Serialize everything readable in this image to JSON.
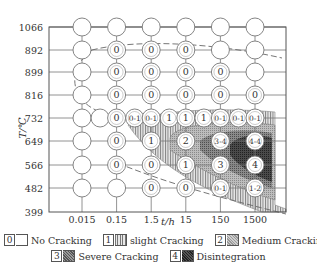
{
  "chart_data": {
    "type": "scatter",
    "subtype": "cracking-map grid (temperature vs. time)",
    "title": "",
    "xlabel": "t/h",
    "ylabel": "T/℃",
    "x_ticks": [
      "0.015",
      "0.15",
      "1.5",
      "15",
      "150",
      "1500"
    ],
    "y_ticks": [
      "1066",
      "892",
      "899",
      "816",
      "732",
      "649",
      "566",
      "482",
      "399"
    ],
    "x_scale": "log",
    "grid": true,
    "legend_position": "bottom",
    "legend": [
      {
        "code": "0",
        "label": "No Cracking"
      },
      {
        "code": "1",
        "label": "slight Cracking"
      },
      {
        "code": "2",
        "label": "Medium Cracking"
      },
      {
        "code": "3",
        "label": "Severe Cracking"
      },
      {
        "code": "4",
        "label": "Disintegration"
      }
    ],
    "rows": [
      {
        "T": "1066",
        "points": [
          {
            "t": "0.015",
            "grade": ""
          },
          {
            "t": "0.15",
            "grade": ""
          },
          {
            "t": "1.5",
            "grade": ""
          },
          {
            "t": "15",
            "grade": ""
          },
          {
            "t": "150",
            "grade": ""
          },
          {
            "t": "1500",
            "grade": ""
          }
        ]
      },
      {
        "T": "892",
        "points": [
          {
            "t": "0.015",
            "grade": ""
          },
          {
            "t": "0.15",
            "grade": "0"
          },
          {
            "t": "1.5",
            "grade": "0"
          },
          {
            "t": "15",
            "grade": "0"
          },
          {
            "t": "150",
            "grade": ""
          },
          {
            "t": "1500",
            "grade": ""
          }
        ]
      },
      {
        "T": "899",
        "points": [
          {
            "t": "0.015",
            "grade": ""
          },
          {
            "t": "0.15",
            "grade": "0"
          },
          {
            "t": "1.5",
            "grade": "0"
          },
          {
            "t": "15",
            "grade": "0"
          },
          {
            "t": "150",
            "grade": "0"
          },
          {
            "t": "1500",
            "grade": ""
          }
        ]
      },
      {
        "T": "816",
        "points": [
          {
            "t": "0.015",
            "grade": ""
          },
          {
            "t": "0.15",
            "grade": "0"
          },
          {
            "t": "1.5",
            "grade": "0"
          },
          {
            "t": "15",
            "grade": "0"
          },
          {
            "t": "150",
            "grade": "0"
          },
          {
            "t": "1500",
            "grade": "0"
          }
        ]
      },
      {
        "T": "732",
        "points": [
          {
            "t": "0.015",
            "grade": ""
          },
          {
            "t": "0.05",
            "grade": ""
          },
          {
            "t": "0.15",
            "grade": "0"
          },
          {
            "t": "0.5",
            "grade": "0-1"
          },
          {
            "t": "1.5",
            "grade": "0-1"
          },
          {
            "t": "5",
            "grade": "1"
          },
          {
            "t": "15",
            "grade": "1"
          },
          {
            "t": "50",
            "grade": "1"
          },
          {
            "t": "150",
            "grade": "0-1"
          },
          {
            "t": "500",
            "grade": "0-1"
          },
          {
            "t": "1500",
            "grade": "0-1"
          }
        ]
      },
      {
        "T": "649",
        "points": [
          {
            "t": "0.015",
            "grade": ""
          },
          {
            "t": "0.15",
            "grade": "0"
          },
          {
            "t": "1.5",
            "grade": "1"
          },
          {
            "t": "15",
            "grade": "2"
          },
          {
            "t": "150",
            "grade": "3-4"
          },
          {
            "t": "1500",
            "grade": "4-4"
          }
        ]
      },
      {
        "T": "566",
        "points": [
          {
            "t": "0.015",
            "grade": ""
          },
          {
            "t": "0.15",
            "grade": "0"
          },
          {
            "t": "1.5",
            "grade": "0"
          },
          {
            "t": "15",
            "grade": "1"
          },
          {
            "t": "150",
            "grade": "3"
          },
          {
            "t": "1500",
            "grade": "4"
          }
        ]
      },
      {
        "T": "482",
        "points": [
          {
            "t": "0.015",
            "grade": ""
          },
          {
            "t": "0.15",
            "grade": ""
          },
          {
            "t": "1.5",
            "grade": "0"
          },
          {
            "t": "15",
            "grade": "0"
          },
          {
            "t": "150",
            "grade": "0-1"
          },
          {
            "t": "1500",
            "grade": "1-2"
          }
        ]
      }
    ],
    "annotations": [
      "dashed boundary curve separating cracking region",
      "shaded contour regions for grades 1-4"
    ]
  }
}
